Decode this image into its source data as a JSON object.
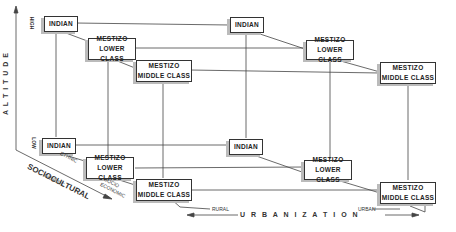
{
  "diagram": {
    "nodes": [
      {
        "id": "hi-rural-indian",
        "text": [
          "INDIAN"
        ]
      },
      {
        "id": "hi-rural-lower",
        "text": [
          "MESTIZO",
          "LOWER CLASS"
        ]
      },
      {
        "id": "hi-rural-middle",
        "text": [
          "MESTIZO",
          "MIDDLE CLASS"
        ]
      },
      {
        "id": "hi-urban-indian",
        "text": [
          "INDIAN"
        ]
      },
      {
        "id": "hi-urban-lower",
        "text": [
          "MESTIZO",
          "LOWER CLASS"
        ]
      },
      {
        "id": "hi-urban-middle",
        "text": [
          "MESTIZO",
          "MIDDLE CLASS"
        ]
      },
      {
        "id": "lo-rural-indian",
        "text": [
          "INDIAN"
        ]
      },
      {
        "id": "lo-rural-lower",
        "text": [
          "MESTIZO",
          "LOWER CLASS"
        ]
      },
      {
        "id": "lo-rural-middle",
        "text": [
          "MESTIZO",
          "MIDDLE CLASS"
        ]
      },
      {
        "id": "lo-urban-indian",
        "text": [
          "INDIAN"
        ]
      },
      {
        "id": "lo-urban-lower",
        "text": [
          "MESTIZO",
          "LOWER CLASS"
        ]
      },
      {
        "id": "lo-urban-middle",
        "text": [
          "MESTIZO",
          "MIDDLE CLASS"
        ]
      }
    ],
    "axes": {
      "altitude": {
        "label": "A L T I T U D E",
        "high": "HIGH",
        "low": "LOW"
      },
      "sociocultural": {
        "label": "SOCIOCULTURAL",
        "sublabel": "GENETIC",
        "ethnic": "ETHNIC",
        "socio1": "SOCIO",
        "socio2": "ECONOMIC"
      },
      "urbanization": {
        "label": "U R B A N I Z A T I O N",
        "rural": "RURAL",
        "urban": "URBAN"
      }
    }
  }
}
